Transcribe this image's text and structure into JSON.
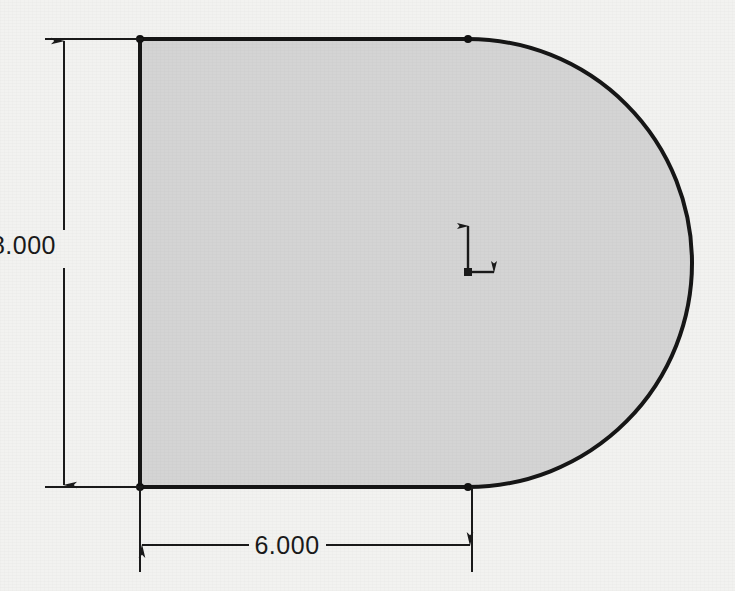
{
  "drawing": {
    "type": "engineering-part-sketch",
    "title": "",
    "background_color": "#f2f2f0",
    "shape": {
      "name": "d-shape-profile",
      "description": "Rectangle with semicircular right end (obround / D-shape)",
      "fill_color": "#d4d4d4",
      "stroke_color": "#161616",
      "stroke_width_px": 4,
      "geometry": {
        "left_x_px": 140,
        "top_y_px": 39,
        "bottom_y_px": 487,
        "tangent_x_px": 468,
        "arc_center_x_px": 468,
        "arc_center_y_px": 263,
        "arc_radius_px": 224,
        "arc_right_x_px": 692
      },
      "endpoint_markers": [
        {
          "name": "top-left-vertex",
          "x": 140,
          "y": 39
        },
        {
          "name": "bottom-left-vertex",
          "x": 140,
          "y": 487
        },
        {
          "name": "top-tangent-point",
          "x": 468,
          "y": 39
        },
        {
          "name": "bottom-tangent-point",
          "x": 468,
          "y": 487
        }
      ]
    },
    "dimensions": [
      {
        "name": "vertical-height-dimension",
        "value": "8.000",
        "orientation": "vertical",
        "placement": "left",
        "line_x_px": 64,
        "from_y_px": 39,
        "to_y_px": 487,
        "text_x_px": 56,
        "text_y_px": 254,
        "extension_from_x_px": 45,
        "extension_to_x_px": 140,
        "arrow_style": "filled-closed"
      },
      {
        "name": "horizontal-width-dimension",
        "value": "6.000",
        "orientation": "horizontal",
        "placement": "bottom",
        "line_y_px": 545,
        "from_x_px": 140,
        "to_x_px": 472,
        "text_x_px": 287,
        "text_y_px": 554,
        "extension_from_y_px": 487,
        "extension_to_y_px": 572,
        "arrow_style": "filled-closed"
      }
    ],
    "origin_marker": {
      "name": "sketch-origin-axes",
      "description": "L-shaped origin indicator with Y-axis arrow up and X-axis arrow right",
      "x_px": 468,
      "y_px": 272,
      "y_axis_length_px": 52,
      "x_axis_length_px": 32,
      "color": "#1a1a1a"
    }
  }
}
